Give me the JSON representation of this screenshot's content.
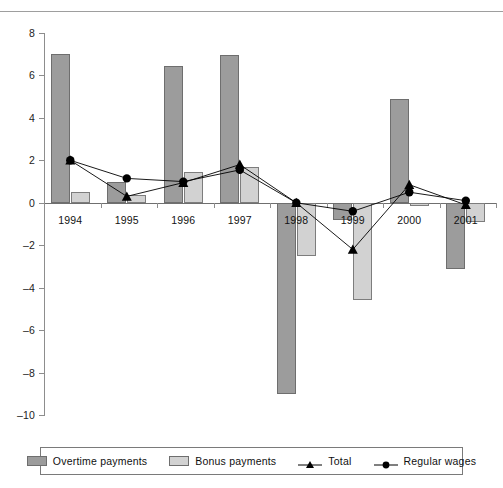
{
  "chart_data": {
    "type": "bar",
    "title": "",
    "subtitle": "",
    "xlabel": "",
    "ylabel": "",
    "categories": [
      "1994",
      "1995",
      "1996",
      "1997",
      "1998",
      "1999",
      "2000",
      "2001"
    ],
    "ylim": [
      -10,
      8
    ],
    "ytick_step": 2,
    "yticks": [
      "8",
      "6",
      "4",
      "2",
      "0",
      "-2",
      "-4",
      "-6",
      "-8",
      "-10"
    ],
    "grid": false,
    "legend_position": "bottom",
    "series": [
      {
        "name": "Overtime payments",
        "kind": "bar",
        "color": "#9c9c9c",
        "values": [
          7.0,
          1.0,
          6.45,
          6.95,
          -9.0,
          -0.8,
          4.9,
          -3.1
        ]
      },
      {
        "name": "Bonus payments",
        "kind": "bar",
        "color": "#d2d2d2",
        "values": [
          0.5,
          0.35,
          1.45,
          1.7,
          -2.5,
          -4.6,
          -0.15,
          -0.9
        ]
      },
      {
        "name": "Total",
        "kind": "line",
        "marker": "triangle",
        "color": "#000000",
        "values": [
          2.0,
          0.3,
          0.95,
          1.8,
          0.0,
          -2.2,
          0.85,
          -0.1
        ]
      },
      {
        "name": "Regular wages",
        "kind": "line",
        "marker": "circle",
        "color": "#000000",
        "values": [
          2.0,
          1.15,
          1.0,
          1.55,
          0.0,
          -0.4,
          0.5,
          0.1
        ]
      }
    ]
  },
  "legend": {
    "items": [
      {
        "label": "Overtime payments",
        "key": "swatch-dark"
      },
      {
        "label": "Bonus payments",
        "key": "swatch-light"
      },
      {
        "label": "Total",
        "key": "triangle-marker"
      },
      {
        "label": "Regular wages",
        "key": "circle-marker"
      }
    ]
  },
  "colors": {
    "overtime": "#9c9c9c",
    "bonus": "#d2d2d2",
    "line": "#000000",
    "axis": "#8d8d8d",
    "background": "#ffffff"
  }
}
